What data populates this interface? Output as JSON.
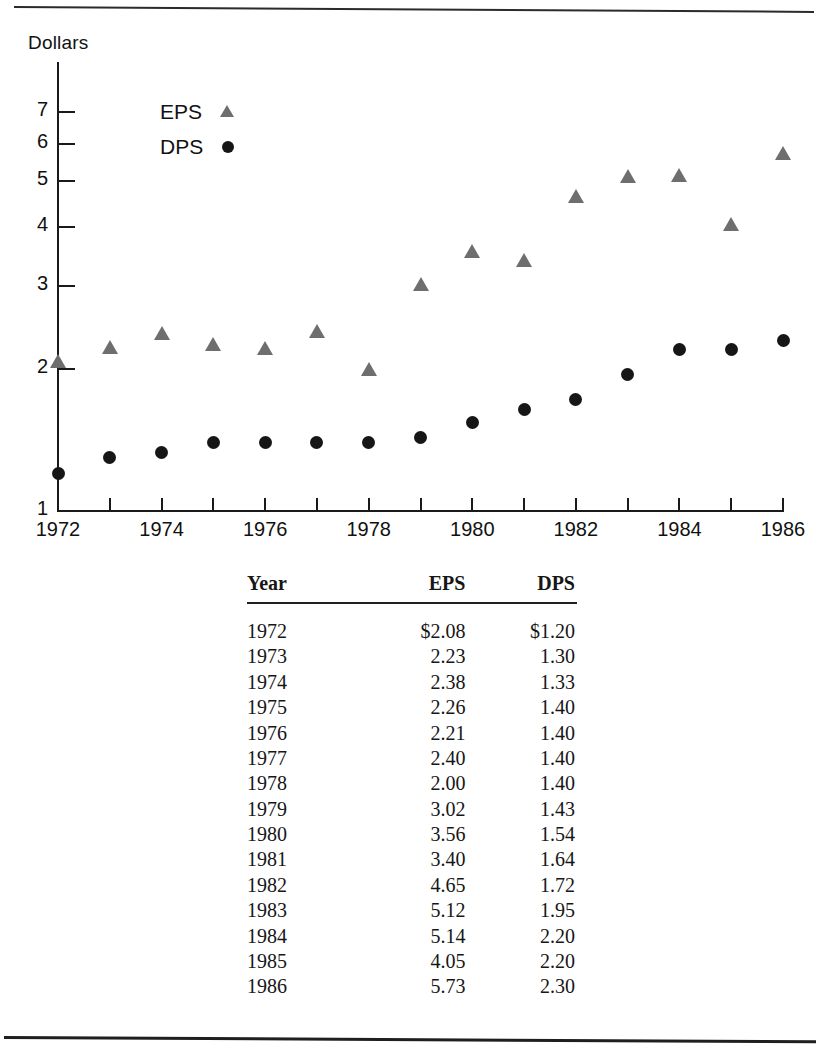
{
  "figure": {
    "y_axis_title": "Dollars"
  },
  "legend": {
    "position": "inside-top-left",
    "entries": [
      {
        "label": "EPS",
        "marker": "triangle-marker-icon",
        "color": "#6e6e6e"
      },
      {
        "label": "DPS",
        "marker": "circle-marker-icon",
        "color": "#161616"
      }
    ]
  },
  "table": {
    "headers": [
      "Year",
      "EPS",
      "DPS"
    ],
    "rows": [
      [
        "1972",
        "$2.08",
        "$1.20"
      ],
      [
        "1973",
        "2.23",
        "1.30"
      ],
      [
        "1974",
        "2.38",
        "1.33"
      ],
      [
        "1975",
        "2.26",
        "1.40"
      ],
      [
        "1976",
        "2.21",
        "1.40"
      ],
      [
        "1977",
        "2.40",
        "1.40"
      ],
      [
        "1978",
        "2.00",
        "1.40"
      ],
      [
        "1979",
        "3.02",
        "1.43"
      ],
      [
        "1980",
        "3.56",
        "1.54"
      ],
      [
        "1981",
        "3.40",
        "1.64"
      ],
      [
        "1982",
        "4.65",
        "1.72"
      ],
      [
        "1983",
        "5.12",
        "1.95"
      ],
      [
        "1984",
        "5.14",
        "2.20"
      ],
      [
        "1985",
        "4.05",
        "2.20"
      ],
      [
        "1986",
        "5.73",
        "2.30"
      ]
    ]
  },
  "chart_data": {
    "type": "scatter",
    "title": "",
    "xlabel": "",
    "ylabel": "Dollars",
    "yscale": "log",
    "ylim": [
      1,
      7.6
    ],
    "xlim": [
      1972,
      1986
    ],
    "grid": false,
    "y_ticks": [
      7,
      6,
      5,
      4,
      3,
      2,
      1
    ],
    "y_tick_labels": [
      "7",
      "6",
      "5",
      "4",
      "3",
      "2",
      "1"
    ],
    "x_ticks": [
      1972,
      1973,
      1974,
      1975,
      1976,
      1977,
      1978,
      1979,
      1980,
      1981,
      1982,
      1983,
      1984,
      1985,
      1986
    ],
    "x_tick_labels": [
      "1972",
      "",
      "1974",
      "",
      "1976",
      "",
      "1978",
      "",
      "1980",
      "",
      "1982",
      "",
      "1984",
      "",
      "1986"
    ],
    "x": [
      1972,
      1973,
      1974,
      1975,
      1976,
      1977,
      1978,
      1979,
      1980,
      1981,
      1982,
      1983,
      1984,
      1985,
      1986
    ],
    "series": [
      {
        "name": "EPS",
        "marker": "triangle",
        "color": "#6e6e6e",
        "values": [
          2.08,
          2.23,
          2.38,
          2.26,
          2.21,
          2.4,
          2.0,
          3.02,
          3.56,
          3.4,
          4.65,
          5.12,
          5.14,
          4.05,
          5.73
        ]
      },
      {
        "name": "DPS",
        "marker": "circle",
        "color": "#161616",
        "values": [
          1.2,
          1.3,
          1.33,
          1.4,
          1.4,
          1.4,
          1.4,
          1.43,
          1.54,
          1.64,
          1.72,
          1.95,
          2.2,
          2.2,
          2.3
        ]
      }
    ]
  }
}
